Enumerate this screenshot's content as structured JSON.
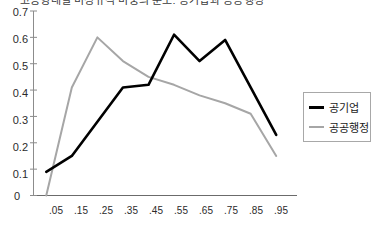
{
  "title": "고용형태별 비정규직 비중의 분포: 공기업과 공공행정",
  "legend": {
    "position": "right",
    "entries": [
      {
        "label": "공기업",
        "color": "#000000"
      },
      {
        "label": "공공행정",
        "color": "#a6a6a6"
      }
    ]
  },
  "axes": {
    "y_ticks": [
      "0.7",
      "0.6",
      "0.5",
      "0.4",
      "0.3",
      "0.2",
      "0.1",
      "0"
    ],
    "x_ticks": [
      ".05",
      ".15",
      ".25",
      ".35",
      ".45",
      ".55",
      ".65",
      ".75",
      ".85",
      ".95"
    ]
  },
  "chart_data": {
    "type": "line",
    "title": "고용형태별 비정규직 비중의 분포: 공기업과 공공행정",
    "xlabel": "",
    "ylabel": "",
    "categories": [
      ".05",
      ".15",
      ".25",
      ".35",
      ".45",
      ".55",
      ".65",
      ".75",
      ".85",
      ".95"
    ],
    "x": [
      0.05,
      0.15,
      0.25,
      0.35,
      0.45,
      0.55,
      0.65,
      0.75,
      0.85,
      0.95
    ],
    "ylim": [
      0,
      0.7
    ],
    "xlim": [
      0.0,
      1.0
    ],
    "grid": false,
    "legend_position": "right",
    "series": [
      {
        "name": "공기업",
        "color": "#000000",
        "values": [
          0.09,
          0.15,
          0.28,
          0.41,
          0.42,
          0.61,
          0.51,
          0.59,
          0.41,
          0.23
        ]
      },
      {
        "name": "공공행정",
        "color": "#a6a6a6",
        "values": [
          0.0,
          0.41,
          0.6,
          0.51,
          0.45,
          0.42,
          0.38,
          0.35,
          0.31,
          0.15
        ]
      }
    ]
  }
}
